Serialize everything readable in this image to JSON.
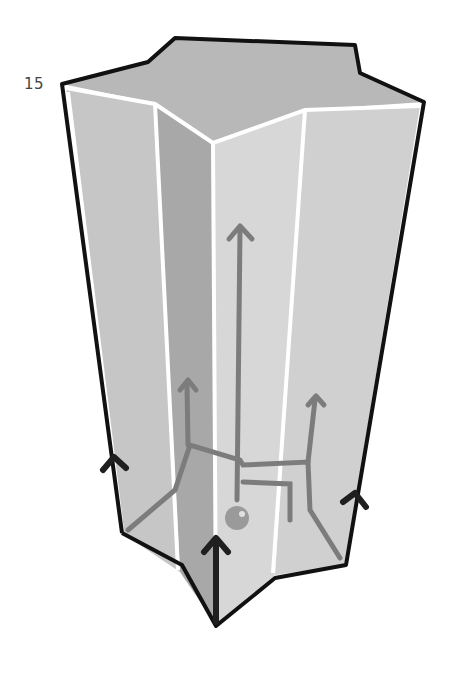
{
  "figure": {
    "label": "15",
    "colors": {
      "top_face": "#b9b9b9",
      "face_light": "#d6d6d6",
      "face_mid": "#c4c4c4",
      "face_dark": "#a9a9a9",
      "outline": "#111111",
      "inner_edge": "#ffffff",
      "internal_lines": "#7a7a7a",
      "base_arrows": "#222222"
    }
  }
}
